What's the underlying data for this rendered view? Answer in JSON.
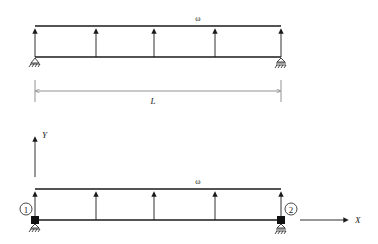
{
  "diagram": {
    "colors": {
      "line": "#1a1a1a",
      "dim_line": "#777777",
      "background": "#ffffff"
    },
    "top_beam": {
      "load_label": "ω",
      "supports": {
        "left": "pin",
        "right": "roller"
      },
      "load_arrow_count": 5
    },
    "dimension": {
      "label": "L"
    },
    "bottom_beam": {
      "load_label": "ω",
      "nodes": [
        {
          "id": "1",
          "label": "1"
        },
        {
          "id": "2",
          "label": "2"
        }
      ],
      "axes": {
        "x_label": "X",
        "y_label": "Y"
      },
      "load_arrow_count": 5
    }
  }
}
